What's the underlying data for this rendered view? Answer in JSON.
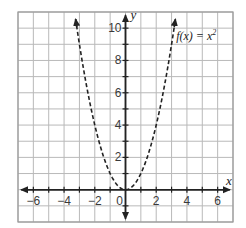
{
  "chart_data": {
    "type": "line",
    "title": "",
    "xlabel": "x",
    "ylabel": "y",
    "xlim": [
      -7,
      7
    ],
    "ylim": [
      -2,
      11
    ],
    "grid": true,
    "grid_step": 1,
    "x_ticks": [
      -6,
      -4,
      -2,
      0,
      2,
      4,
      6
    ],
    "x_tick_labels": [
      "−6",
      "−4",
      "−2",
      "0",
      "2",
      "4",
      "6"
    ],
    "y_ticks": [
      2,
      4,
      6,
      8,
      10
    ],
    "y_tick_labels": [
      "2",
      "4",
      "6",
      "8",
      "10"
    ],
    "series": [
      {
        "name": "f(x) = x²",
        "style": "dashed",
        "arrows": "both-ends",
        "x": [
          -3.25,
          -3,
          -2.5,
          -2,
          -1.5,
          -1,
          -0.5,
          0,
          0.5,
          1,
          1.5,
          2,
          2.5,
          3,
          3.25
        ],
        "y": [
          10.56,
          9,
          6.25,
          4,
          2.25,
          1,
          0.25,
          0,
          0.25,
          1,
          2.25,
          4,
          6.25,
          9,
          10.56
        ]
      }
    ],
    "annotations": [
      {
        "text": "f(x) = x²",
        "x": 3.3,
        "y": 9.5
      }
    ]
  },
  "labels": {
    "x_axis": "x",
    "y_axis": "y",
    "function_prefix": "f(x) = x",
    "function_exponent": "2",
    "x_ticks": [
      "−6",
      "−4",
      "−2",
      "0",
      "2",
      "4",
      "6"
    ],
    "y_ticks": [
      "2",
      "4",
      "6",
      "8",
      "10"
    ]
  },
  "colors": {
    "grid": "#b9b9b9",
    "axis": "#222222",
    "curve": "#222222",
    "background": "#ffffff"
  }
}
